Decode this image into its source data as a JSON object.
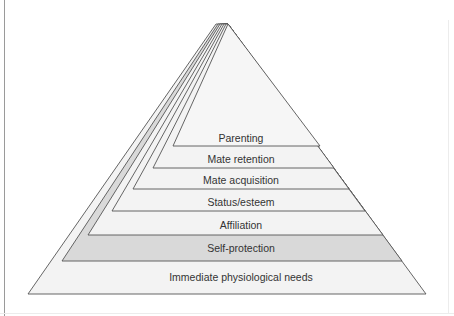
{
  "diagram": {
    "type": "pyramid",
    "apex": {
      "x": 222,
      "y": 24
    },
    "colors": {
      "stroke": "#555555",
      "fill_light": "#f3f3f3",
      "fill_highlight": "#d9d9d9"
    },
    "layers": [
      {
        "label": "Immediate physiological needs",
        "highlight": false
      },
      {
        "label": "Self-protection",
        "highlight": true
      },
      {
        "label": "Affiliation",
        "highlight": false
      },
      {
        "label": "Status/esteem",
        "highlight": false
      },
      {
        "label": "Mate acquisition",
        "highlight": false
      },
      {
        "label": "Mate retention",
        "highlight": false
      },
      {
        "label": "Parenting",
        "highlight": false
      }
    ]
  }
}
